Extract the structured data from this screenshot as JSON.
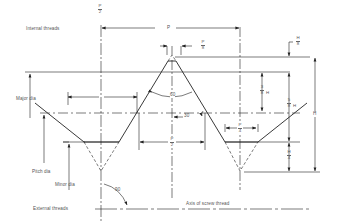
{
  "figure": {
    "labels": {
      "internal_threads": "Internal threads",
      "external_threads": "External threads",
      "major_dia": "Major dia",
      "pitch_dia": "Pitch dia",
      "minor_dia": "Minor dia",
      "axis": "Axis of screw thread"
    },
    "dimensions": {
      "p_over_2_top": {
        "num": "P",
        "den": "2"
      },
      "p": "P",
      "p_over_8": {
        "num": "P",
        "den": "8"
      },
      "h_over_8": {
        "num": "H",
        "den": "8"
      },
      "three_eighths_h": {
        "num": "3",
        "den": "8",
        "suffix": "H"
      },
      "five_eighths_h": {
        "num": "5",
        "den": "8",
        "suffix": "H"
      },
      "h": "H",
      "h_over_4": {
        "num": "H",
        "den": "4"
      },
      "p_over_2_mid": {
        "num": "P",
        "den": "2"
      },
      "p_over_4": {
        "num": "P",
        "den": "4"
      }
    },
    "angles": {
      "included": "60",
      "half": "30",
      "right_angle": "90"
    },
    "colors": {
      "line": "#222222",
      "text": "#555555",
      "background": "#ffffff"
    }
  }
}
